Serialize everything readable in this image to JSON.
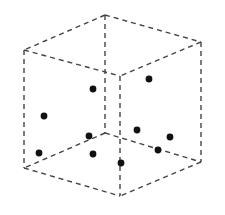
{
  "diagram": {
    "type": "dashed-wireframe-cube-with-points",
    "edge_color": "#444444",
    "point_color": "#111111",
    "point_radius": 3.4,
    "vertices": {
      "back_top": [
        105,
        15
      ],
      "left_top": [
        24,
        50
      ],
      "right_top": [
        201,
        42
      ],
      "front_top": [
        120,
        76
      ],
      "back_bottom": [
        105,
        133
      ],
      "left_bottom": [
        24,
        168
      ],
      "right_bottom": [
        201,
        162
      ],
      "front_bottom": [
        120,
        196
      ]
    },
    "edges": [
      [
        "back_top",
        "left_top"
      ],
      [
        "back_top",
        "right_top"
      ],
      [
        "left_top",
        "front_top"
      ],
      [
        "right_top",
        "front_top"
      ],
      [
        "back_bottom",
        "left_bottom"
      ],
      [
        "back_bottom",
        "right_bottom"
      ],
      [
        "left_bottom",
        "front_bottom"
      ],
      [
        "right_bottom",
        "front_bottom"
      ],
      [
        "back_top",
        "back_bottom"
      ],
      [
        "left_top",
        "left_bottom"
      ],
      [
        "right_top",
        "right_bottom"
      ],
      [
        "front_top",
        "front_bottom"
      ]
    ],
    "points": [
      [
        149,
        79
      ],
      [
        93,
        89
      ],
      [
        44,
        116
      ],
      [
        137,
        130
      ],
      [
        89,
        136
      ],
      [
        170,
        137
      ],
      [
        158,
        150
      ],
      [
        39,
        153
      ],
      [
        93,
        154
      ],
      [
        121,
        163
      ]
    ],
    "point_count": 10
  }
}
